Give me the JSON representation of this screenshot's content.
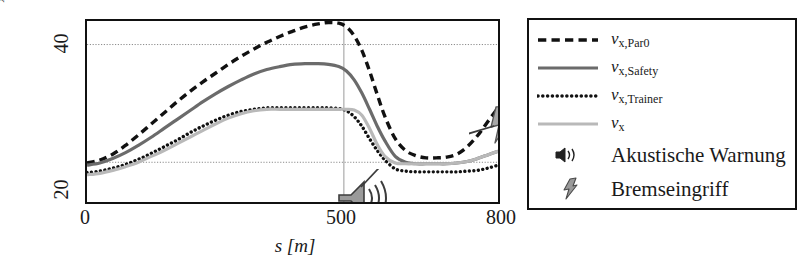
{
  "chart_data": {
    "type": "line",
    "title": "",
    "xlabel": "s [m]",
    "ylabel": "v_x [m/s]",
    "xlim": [
      0,
      800
    ],
    "ylim": [
      18.6,
      43.2
    ],
    "xticks": [
      0,
      500,
      800
    ],
    "yticks": [
      20,
      40
    ],
    "grid": true,
    "gridlines": {
      "horizontal": [
        40,
        24
      ],
      "vertical": [
        500
      ]
    },
    "legend_position": "right-outside",
    "series": [
      {
        "name": "v_x,Par0",
        "style": "dashed",
        "color": "#111111",
        "width": 3.4,
        "x": [
          0,
          25,
          50,
          75,
          100,
          125,
          150,
          175,
          200,
          225,
          250,
          275,
          300,
          325,
          350,
          375,
          400,
          425,
          450,
          470,
          490,
          505,
          520,
          535,
          550,
          565,
          580,
          600,
          620,
          640,
          660,
          680,
          700,
          720,
          740,
          760,
          780,
          800
        ],
        "y": [
          23.9,
          24.3,
          25.1,
          26.3,
          27.7,
          29.2,
          30.7,
          32.2,
          33.6,
          34.9,
          36.1,
          37.3,
          38.4,
          39.4,
          40.3,
          41.1,
          41.8,
          42.4,
          42.8,
          43.0,
          42.9,
          42.4,
          41.2,
          39.2,
          36.4,
          33.2,
          30.2,
          27.2,
          25.6,
          24.9,
          24.6,
          24.6,
          24.7,
          25.1,
          26.1,
          27.6,
          29.5,
          31.4
        ]
      },
      {
        "name": "v_x,Safety",
        "style": "solid",
        "color": "#6b6b6b",
        "width": 3.2,
        "x": [
          0,
          25,
          50,
          75,
          100,
          125,
          150,
          175,
          200,
          225,
          250,
          275,
          300,
          325,
          350,
          375,
          400,
          425,
          450,
          470,
          490,
          505,
          520,
          535,
          550,
          565,
          580,
          600,
          620,
          640,
          660,
          680,
          700,
          720,
          740,
          760,
          780,
          800
        ],
        "y": [
          23.6,
          23.9,
          24.5,
          25.3,
          26.3,
          27.4,
          28.6,
          29.8,
          31.0,
          32.2,
          33.3,
          34.3,
          35.2,
          36.0,
          36.6,
          37.0,
          37.3,
          37.4,
          37.4,
          37.3,
          37.0,
          36.4,
          35.2,
          33.4,
          31.2,
          28.9,
          26.9,
          24.8,
          24.0,
          23.8,
          23.8,
          23.8,
          23.8,
          23.9,
          24.1,
          24.5,
          25.0,
          25.5
        ]
      },
      {
        "name": "v_x,Trainer",
        "style": "dotted",
        "color": "#111111",
        "width": 3.4,
        "x": [
          0,
          25,
          50,
          75,
          100,
          125,
          150,
          175,
          200,
          225,
          250,
          275,
          300,
          325,
          350,
          375,
          400,
          425,
          450,
          470,
          490,
          505,
          520,
          535,
          550,
          565,
          580,
          600,
          620,
          640,
          660,
          680,
          700,
          720,
          740,
          760,
          780,
          800
        ],
        "y": [
          22.6,
          22.8,
          23.2,
          23.7,
          24.4,
          25.2,
          26.1,
          27.0,
          28.0,
          28.9,
          29.7,
          30.4,
          30.9,
          31.2,
          31.4,
          31.4,
          31.4,
          31.4,
          31.4,
          31.4,
          31.3,
          31.0,
          30.2,
          28.9,
          27.2,
          25.6,
          24.3,
          23.1,
          22.8,
          22.7,
          22.7,
          22.7,
          22.7,
          22.7,
          22.8,
          22.9,
          23.2,
          23.6
        ]
      },
      {
        "name": "v_x",
        "style": "solid",
        "color": "#b9b9b9",
        "width": 3.2,
        "x": [
          0,
          25,
          50,
          75,
          100,
          125,
          150,
          175,
          200,
          225,
          250,
          275,
          300,
          325,
          350,
          375,
          400,
          425,
          450,
          470,
          490,
          505,
          520,
          535,
          550,
          565,
          580,
          600,
          620,
          640,
          660,
          680,
          700,
          720,
          740,
          760,
          780,
          800
        ],
        "y": [
          22.3,
          22.5,
          22.9,
          23.4,
          24.0,
          24.8,
          25.6,
          26.5,
          27.4,
          28.3,
          29.2,
          30.0,
          30.6,
          31.0,
          31.2,
          31.2,
          31.2,
          31.2,
          31.2,
          31.2,
          31.2,
          31.2,
          31.1,
          30.4,
          28.6,
          26.4,
          24.8,
          23.9,
          23.8,
          23.8,
          23.8,
          23.8,
          23.8,
          23.9,
          24.1,
          24.5,
          25.0,
          25.5
        ]
      }
    ],
    "annotations": [
      {
        "name": "akustische-warnung",
        "icon": "speaker-icon",
        "points_to_x": 430,
        "points_to_y": 31.3
      },
      {
        "name": "bremseingriff",
        "icon": "lightning-bolt-icon",
        "points_to_x": 515,
        "points_to_y": 31.2
      }
    ]
  },
  "axes": {
    "ylabel_main": "v",
    "ylabel_sub": "x",
    "ylabel_unit": "[m/s]",
    "ytick_40": "40",
    "ytick_20": "20",
    "xtick_0": "0",
    "xtick_500": "500",
    "xtick_800": "800",
    "xlabel": "s [m]"
  },
  "legend": {
    "entries": [
      {
        "label_main": "v",
        "label_sub": "x,Par0",
        "style": "dashed",
        "color": "#111111"
      },
      {
        "label_main": "v",
        "label_sub": "x,Safety",
        "style": "solid",
        "color": "#6b6b6b"
      },
      {
        "label_main": "v",
        "label_sub": "x,Trainer",
        "style": "dotted",
        "color": "#111111"
      },
      {
        "label_main": "v",
        "label_sub": "x",
        "style": "solid",
        "color": "#b9b9b9"
      }
    ],
    "icon_entries": [
      {
        "icon": "speaker-icon",
        "label": "Akustische Warnung"
      },
      {
        "icon": "lightning-bolt-icon",
        "label": "Bremseingriff"
      }
    ]
  }
}
